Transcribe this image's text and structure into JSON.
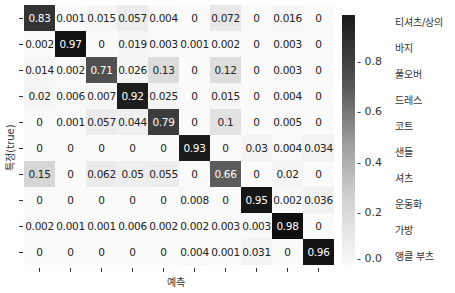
{
  "chart_data": {
    "type": "heatmap",
    "title": "",
    "xlabel": "예측",
    "ylabel": "특정(true)",
    "class_labels": [
      "티셔츠/상의",
      "바지",
      "풀오버",
      "드레스",
      "코트",
      "샌들",
      "셔츠",
      "운동화",
      "가방",
      "앵클 부츠"
    ],
    "matrix": [
      [
        "0.83",
        "0.001",
        "0.015",
        "0.057",
        "0.004",
        "0",
        "0.072",
        "0",
        "0.016",
        "0"
      ],
      [
        "0.002",
        "0.97",
        "0",
        "0.019",
        "0.003",
        "0.001",
        "0.002",
        "0",
        "0.003",
        "0"
      ],
      [
        "0.014",
        "0.002",
        "0.71",
        "0.026",
        "0.13",
        "0",
        "0.12",
        "0",
        "0.003",
        "0"
      ],
      [
        "0.02",
        "0.006",
        "0.007",
        "0.92",
        "0.025",
        "0",
        "0.015",
        "0",
        "0.004",
        "0"
      ],
      [
        "0",
        "0.001",
        "0.057",
        "0.044",
        "0.79",
        "0",
        "0.1",
        "0",
        "0.005",
        "0"
      ],
      [
        "0",
        "0",
        "0",
        "0",
        "0",
        "0.93",
        "0",
        "0.03",
        "0.004",
        "0.034"
      ],
      [
        "0.15",
        "0",
        "0.062",
        "0.05",
        "0.055",
        "0",
        "0.66",
        "0",
        "0.02",
        "0"
      ],
      [
        "0",
        "0",
        "0",
        "0",
        "0",
        "0.008",
        "0",
        "0.95",
        "0.002",
        "0.036"
      ],
      [
        "0.002",
        "0.001",
        "0.001",
        "0.006",
        "0.002",
        "0.002",
        "0.003",
        "0.003",
        "0.98",
        "0"
      ],
      [
        "0",
        "0",
        "0",
        "0",
        "0",
        "0.004",
        "0.001",
        "0.031",
        "0",
        "0.96"
      ]
    ],
    "colorbar": {
      "ticks": [
        "0.8",
        "0.6",
        "0.4",
        "0.2",
        "0.0"
      ],
      "range": [
        0,
        0.98
      ],
      "colormap": "Greys"
    },
    "grid": false,
    "legend_position": "right"
  }
}
